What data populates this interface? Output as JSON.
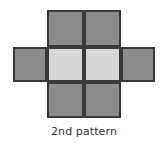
{
  "figure": {
    "caption": "2nd pattern",
    "background_color": "#ffffff",
    "border_color": "#3a3a3a",
    "dark_fill": "#8b8b8b",
    "light_fill": "#d6d6d6",
    "caption_color": "#333333",
    "shape_name": "plus-cross-grid",
    "cells": [
      {
        "id": "top-left",
        "shade": "dark",
        "fill": "#8b8b8b",
        "row": 1,
        "col": 2
      },
      {
        "id": "top-right",
        "shade": "dark",
        "fill": "#8b8b8b",
        "row": 1,
        "col": 3
      },
      {
        "id": "mid-far-left",
        "shade": "dark",
        "fill": "#8b8b8b",
        "row": 2,
        "col": 1
      },
      {
        "id": "mid-left",
        "shade": "light",
        "fill": "#d6d6d6",
        "row": 2,
        "col": 2
      },
      {
        "id": "mid-right",
        "shade": "light",
        "fill": "#d6d6d6",
        "row": 2,
        "col": 3
      },
      {
        "id": "mid-far-right",
        "shade": "dark",
        "fill": "#8b8b8b",
        "row": 2,
        "col": 4
      },
      {
        "id": "bottom-left",
        "shade": "dark",
        "fill": "#8b8b8b",
        "row": 3,
        "col": 2
      },
      {
        "id": "bottom-right",
        "shade": "dark",
        "fill": "#8b8b8b",
        "row": 3,
        "col": 3
      }
    ]
  }
}
